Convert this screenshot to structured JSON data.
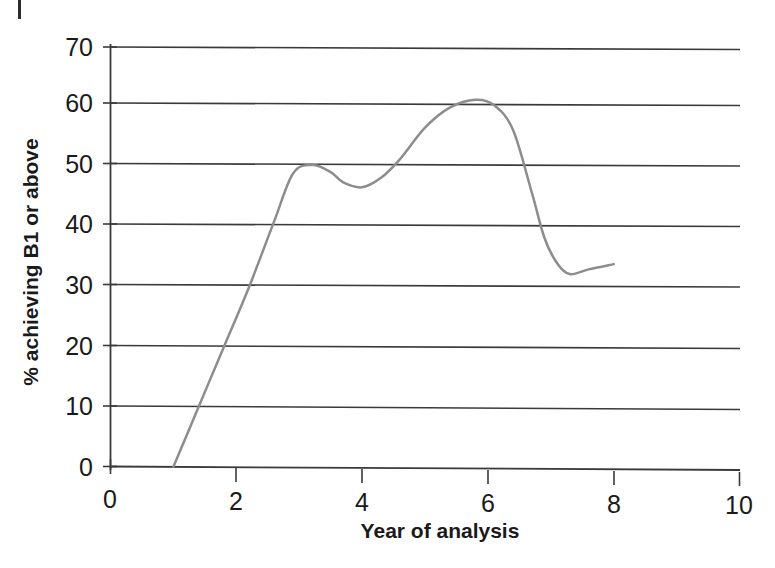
{
  "figure": {
    "background_color": "#ffffff",
    "line_color": "#8d8d8d",
    "axis_color": "#3a3a3a",
    "edge_mark": ""
  },
  "chart_data": {
    "type": "line",
    "title": "",
    "xlabel": "Year of analysis",
    "ylabel": "% achieving B1 or above",
    "xlim": [
      0,
      10
    ],
    "ylim": [
      0,
      70
    ],
    "grid": true,
    "grid_axis": "y",
    "legend": false,
    "legend_position": "none",
    "xticks": [
      0,
      2,
      4,
      6,
      8,
      10
    ],
    "xtick_labels": [
      "0",
      "2",
      "4",
      "6",
      "8",
      "10"
    ],
    "yticks": [
      0,
      10,
      20,
      30,
      40,
      50,
      60,
      70
    ],
    "ytick_labels": [
      "0",
      "10",
      "20",
      "30",
      "40",
      "50",
      "60",
      "70"
    ],
    "series": [
      {
        "name": "% achieving B1 or above",
        "color": "#8d8d8d",
        "x": [
          1.0,
          1.4,
          1.8,
          2.2,
          2.6,
          2.9,
          3.2,
          3.5,
          3.7,
          4.0,
          4.3,
          4.6,
          5.0,
          5.4,
          5.8,
          6.1,
          6.4,
          6.7,
          6.9,
          7.1,
          7.3,
          7.6,
          8.0
        ],
        "y": [
          0.0,
          10.0,
          20.0,
          30.0,
          41.0,
          49.0,
          50.5,
          49.3,
          47.6,
          46.8,
          48.4,
          51.5,
          56.8,
          60.2,
          61.5,
          60.6,
          56.5,
          46.0,
          38.5,
          34.3,
          32.5,
          33.3,
          34.2
        ]
      }
    ],
    "annotations": []
  }
}
